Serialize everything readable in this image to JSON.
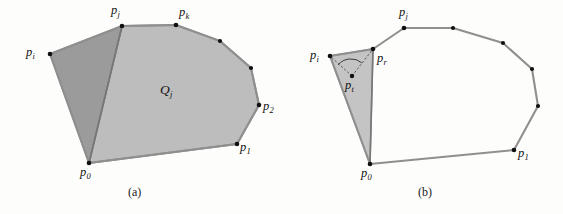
{
  "figure": {
    "background_color": "#fdfdfc",
    "dark_fill": "#9b9b9b",
    "light_fill": "#bdbdbd",
    "edge_color": "#8f8f8f",
    "vertex_color": "#101010"
  },
  "panel_a": {
    "caption": "(a)",
    "region_label": "Q",
    "region_label_sub": "j",
    "labels": [
      {
        "name": "p-i",
        "base": "p",
        "sub": "i"
      },
      {
        "name": "p-j",
        "base": "p",
        "sub": "j"
      },
      {
        "name": "p-k",
        "base": "p",
        "sub": "k"
      },
      {
        "name": "p-2",
        "base": "p",
        "sub": "2"
      },
      {
        "name": "p-1",
        "base": "p",
        "sub": "1"
      },
      {
        "name": "p-0",
        "base": "p",
        "sub": "0"
      }
    ],
    "vertices": [
      {
        "name": "p0",
        "x": 89,
        "y": 163
      },
      {
        "name": "pi",
        "x": 50,
        "y": 54
      },
      {
        "name": "pj",
        "x": 122,
        "y": 26
      },
      {
        "name": "pk",
        "x": 176,
        "y": 25
      },
      {
        "name": "v4",
        "x": 220,
        "y": 41
      },
      {
        "name": "v5",
        "x": 251,
        "y": 68
      },
      {
        "name": "p2",
        "x": 259,
        "y": 105
      },
      {
        "name": "p1",
        "x": 237,
        "y": 144
      }
    ]
  },
  "panel_b": {
    "caption": "(b)",
    "labels": [
      {
        "name": "p-i",
        "base": "p",
        "sub": "i"
      },
      {
        "name": "p-r",
        "base": "p",
        "sub": "r"
      },
      {
        "name": "p-t",
        "base": "p",
        "sub": "t"
      },
      {
        "name": "p-j",
        "base": "p",
        "sub": "j"
      },
      {
        "name": "p-1",
        "base": "p",
        "sub": "1"
      },
      {
        "name": "p-0",
        "base": "p",
        "sub": "0"
      }
    ],
    "vertices": [
      {
        "name": "p0",
        "x": 370,
        "y": 164
      },
      {
        "name": "pi",
        "x": 330,
        "y": 56
      },
      {
        "name": "pr",
        "x": 373,
        "y": 49
      },
      {
        "name": "pt",
        "x": 352,
        "y": 76
      },
      {
        "name": "pj",
        "x": 404,
        "y": 28
      },
      {
        "name": "v5",
        "x": 453,
        "y": 28
      },
      {
        "name": "v6",
        "x": 503,
        "y": 43
      },
      {
        "name": "v7",
        "x": 532,
        "y": 69
      },
      {
        "name": "v8",
        "x": 538,
        "y": 106
      },
      {
        "name": "p1",
        "x": 514,
        "y": 150
      }
    ]
  }
}
